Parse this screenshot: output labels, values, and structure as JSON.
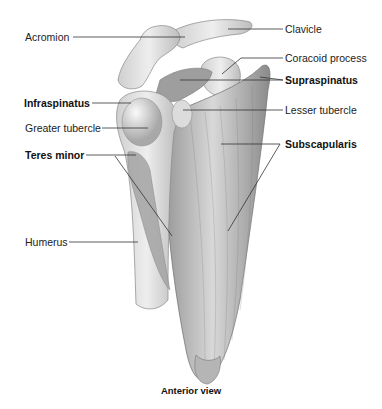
{
  "figure": {
    "caption": "Anterior view",
    "colors": {
      "background": "#ffffff",
      "bone_light": "#e6e6e6",
      "bone_mid": "#c8c8c8",
      "muscle_dark": "#8c8c8c",
      "muscle_mid": "#b0b0b0",
      "leader_line": "#333333",
      "label_text": "#222222"
    }
  },
  "labels": {
    "left": [
      {
        "id": "acromion",
        "text": "Acromion",
        "bold": false
      },
      {
        "id": "infraspinatus",
        "text": "Infraspinatus",
        "bold": true
      },
      {
        "id": "greater_tubercle",
        "text": "Greater tubercle",
        "bold": false
      },
      {
        "id": "teres_minor",
        "text": "Teres minor",
        "bold": true
      },
      {
        "id": "humerus",
        "text": "Humerus",
        "bold": false
      }
    ],
    "right": [
      {
        "id": "clavicle",
        "text": "Clavicle",
        "bold": false
      },
      {
        "id": "coracoid_process",
        "text": "Coracoid process",
        "bold": false
      },
      {
        "id": "supraspinatus",
        "text": "Supraspinatus",
        "bold": true
      },
      {
        "id": "lesser_tubercle",
        "text": "Lesser tubercle",
        "bold": false
      },
      {
        "id": "subscapularis",
        "text": "Subscapularis",
        "bold": true
      }
    ]
  }
}
